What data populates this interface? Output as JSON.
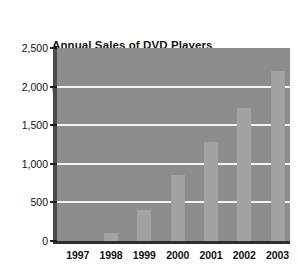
{
  "chart_data": {
    "type": "bar",
    "title": "Annual Sales of DVD Players (000s)",
    "title_lines": [
      "Annual Sales of DVD Players",
      "(000s)"
    ],
    "categories": [
      "1997",
      "1998",
      "1999",
      "2000",
      "2001",
      "2002",
      "2003"
    ],
    "values": [
      0,
      100,
      400,
      850,
      1280,
      1720,
      2200
    ],
    "series": [
      {
        "name": "Annual Sales of DVD Players",
        "values": [
          0,
          100,
          400,
          850,
          1280,
          1720,
          2200
        ]
      }
    ],
    "xlabel": "",
    "ylabel": "",
    "ylim": [
      0,
      2500
    ],
    "yticks": [
      0,
      500,
      1000,
      1500,
      2000,
      2500
    ],
    "ytick_labels": [
      "0",
      "500",
      "1,000",
      "1,500",
      "2,000",
      "2,500"
    ],
    "gridlines": [
      500,
      1000,
      1500,
      2000
    ],
    "grid": true,
    "legend": false,
    "legend_position": "none",
    "units": "thousands",
    "colors": {
      "plot_background": "#8d8d8d",
      "bar_fill": "#a3a3a3",
      "gridline": "#f4f4f4",
      "axis": "#2e2e2e",
      "text": "#111111",
      "page_background": "#ffffff"
    }
  }
}
